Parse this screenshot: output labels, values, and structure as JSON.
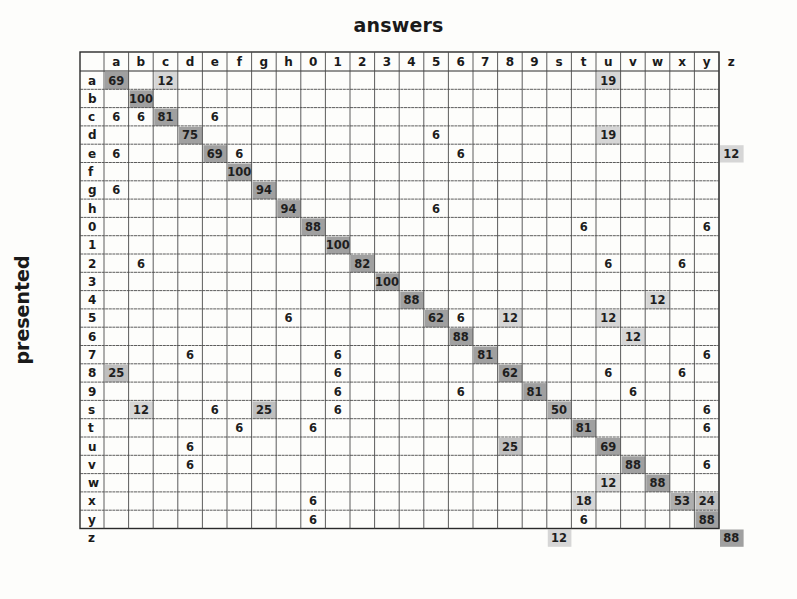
{
  "chart_data": {
    "type": "heatmap",
    "title": "answers",
    "xlabel": "answers",
    "ylabel": "presented",
    "columns": [
      "a",
      "b",
      "c",
      "d",
      "e",
      "f",
      "g",
      "h",
      "0",
      "1",
      "2",
      "3",
      "4",
      "5",
      "6",
      "7",
      "8",
      "9",
      "s",
      "t",
      "u",
      "v",
      "w",
      "x",
      "y",
      "z"
    ],
    "rows": [
      "a",
      "b",
      "c",
      "d",
      "e",
      "f",
      "g",
      "h",
      "0",
      "1",
      "2",
      "3",
      "4",
      "5",
      "6",
      "7",
      "8",
      "9",
      "s",
      "t",
      "u",
      "v",
      "w",
      "x",
      "y",
      "z"
    ],
    "value_unit": "percent",
    "cells": [
      {
        "row": "a",
        "col": "a",
        "value": 69
      },
      {
        "row": "a",
        "col": "c",
        "value": 12
      },
      {
        "row": "a",
        "col": "u",
        "value": 19
      },
      {
        "row": "b",
        "col": "b",
        "value": 100
      },
      {
        "row": "c",
        "col": "a",
        "value": 6
      },
      {
        "row": "c",
        "col": "b",
        "value": 6
      },
      {
        "row": "c",
        "col": "c",
        "value": 81
      },
      {
        "row": "c",
        "col": "e",
        "value": 6
      },
      {
        "row": "d",
        "col": "d",
        "value": 75
      },
      {
        "row": "d",
        "col": "5",
        "value": 6
      },
      {
        "row": "d",
        "col": "u",
        "value": 19
      },
      {
        "row": "e",
        "col": "a",
        "value": 6
      },
      {
        "row": "e",
        "col": "e",
        "value": 69
      },
      {
        "row": "e",
        "col": "f",
        "value": 6
      },
      {
        "row": "e",
        "col": "6",
        "value": 6
      },
      {
        "row": "e",
        "col": "z",
        "value": 12
      },
      {
        "row": "f",
        "col": "f",
        "value": 100
      },
      {
        "row": "g",
        "col": "a",
        "value": 6
      },
      {
        "row": "g",
        "col": "g",
        "value": 94
      },
      {
        "row": "h",
        "col": "h",
        "value": 94
      },
      {
        "row": "h",
        "col": "5",
        "value": 6
      },
      {
        "row": "0",
        "col": "0",
        "value": 88
      },
      {
        "row": "0",
        "col": "t",
        "value": 6
      },
      {
        "row": "0",
        "col": "y",
        "value": 6
      },
      {
        "row": "1",
        "col": "1",
        "value": 100
      },
      {
        "row": "2",
        "col": "b",
        "value": 6
      },
      {
        "row": "2",
        "col": "2",
        "value": 82
      },
      {
        "row": "2",
        "col": "u",
        "value": 6
      },
      {
        "row": "2",
        "col": "x",
        "value": 6
      },
      {
        "row": "3",
        "col": "3",
        "value": 100
      },
      {
        "row": "4",
        "col": "4",
        "value": 88
      },
      {
        "row": "4",
        "col": "w",
        "value": 12
      },
      {
        "row": "5",
        "col": "h",
        "value": 6
      },
      {
        "row": "5",
        "col": "5",
        "value": 62
      },
      {
        "row": "5",
        "col": "6",
        "value": 6
      },
      {
        "row": "5",
        "col": "8",
        "value": 12
      },
      {
        "row": "5",
        "col": "u",
        "value": 12
      },
      {
        "row": "6",
        "col": "6",
        "value": 88
      },
      {
        "row": "6",
        "col": "v",
        "value": 12
      },
      {
        "row": "7",
        "col": "d",
        "value": 6
      },
      {
        "row": "7",
        "col": "1",
        "value": 6
      },
      {
        "row": "7",
        "col": "7",
        "value": 81
      },
      {
        "row": "7",
        "col": "y",
        "value": 6
      },
      {
        "row": "8",
        "col": "a",
        "value": 25
      },
      {
        "row": "8",
        "col": "1",
        "value": 6
      },
      {
        "row": "8",
        "col": "8",
        "value": 62
      },
      {
        "row": "8",
        "col": "u",
        "value": 6
      },
      {
        "row": "8",
        "col": "x",
        "value": 6
      },
      {
        "row": "9",
        "col": "1",
        "value": 6
      },
      {
        "row": "9",
        "col": "6",
        "value": 6
      },
      {
        "row": "9",
        "col": "9",
        "value": 81
      },
      {
        "row": "9",
        "col": "v",
        "value": 6
      },
      {
        "row": "s",
        "col": "b",
        "value": 12
      },
      {
        "row": "s",
        "col": "e",
        "value": 6
      },
      {
        "row": "s",
        "col": "g",
        "value": 25
      },
      {
        "row": "s",
        "col": "1",
        "value": 6
      },
      {
        "row": "s",
        "col": "s",
        "value": 50
      },
      {
        "row": "s",
        "col": "y",
        "value": 6
      },
      {
        "row": "t",
        "col": "f",
        "value": 6
      },
      {
        "row": "t",
        "col": "0",
        "value": 6
      },
      {
        "row": "t",
        "col": "t",
        "value": 81
      },
      {
        "row": "t",
        "col": "y",
        "value": 6
      },
      {
        "row": "u",
        "col": "d",
        "value": 6
      },
      {
        "row": "u",
        "col": "8",
        "value": 25
      },
      {
        "row": "u",
        "col": "u",
        "value": 69
      },
      {
        "row": "v",
        "col": "d",
        "value": 6
      },
      {
        "row": "v",
        "col": "v",
        "value": 88
      },
      {
        "row": "v",
        "col": "y",
        "value": 6
      },
      {
        "row": "w",
        "col": "u",
        "value": 12
      },
      {
        "row": "w",
        "col": "w",
        "value": 88
      },
      {
        "row": "x",
        "col": "0",
        "value": 6
      },
      {
        "row": "x",
        "col": "t",
        "value": 18
      },
      {
        "row": "x",
        "col": "x",
        "value": 53
      },
      {
        "row": "x",
        "col": "y",
        "value": 24
      },
      {
        "row": "y",
        "col": "0",
        "value": 6
      },
      {
        "row": "y",
        "col": "t",
        "value": 6
      },
      {
        "row": "y",
        "col": "y",
        "value": 88
      },
      {
        "row": "z",
        "col": "s",
        "value": 12
      },
      {
        "row": "z",
        "col": "z",
        "value": 88
      }
    ],
    "shading": {
      "shade_threshold": 10,
      "high_color": "#8f8f8f",
      "mid_color": "#b4b4b4",
      "low_color": "#cfcfcf",
      "grid_color": "#4a4a4a"
    },
    "grid": true
  }
}
